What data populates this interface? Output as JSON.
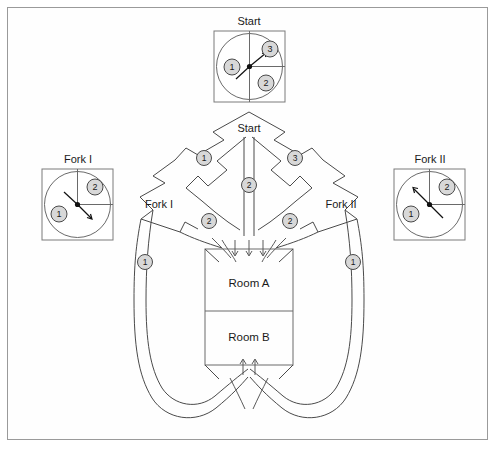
{
  "figure": {
    "title": "",
    "background_color": "#ffffff",
    "frame_color": "#9a9a9a"
  },
  "insets": [
    {
      "id": "start",
      "label": "Start",
      "segments": [
        {
          "number": "1",
          "position": "left-half"
        },
        {
          "number": "2",
          "position": "lower-right-quadrant"
        },
        {
          "number": "3",
          "position": "upper-right-quadrant"
        }
      ],
      "arrow_direction": "up-right",
      "arrow_target": "3"
    },
    {
      "id": "fork-1",
      "label": "Fork I",
      "segments": [
        {
          "number": "1",
          "position": "lower-left"
        },
        {
          "number": "2",
          "position": "upper-right-quadrant"
        }
      ],
      "arrow_direction": "down-right",
      "arrow_target": "1"
    },
    {
      "id": "fork-2",
      "label": "Fork II",
      "segments": [
        {
          "number": "1",
          "position": "lower-left"
        },
        {
          "number": "2",
          "position": "upper-right-quadrant"
        }
      ],
      "arrow_direction": "up-left",
      "arrow_target": "2"
    }
  ],
  "maze": {
    "start_label": "Start",
    "fork_1_label": "Fork I",
    "fork_2_label": "Fork II",
    "rooms": [
      {
        "id": "room-a",
        "label": "Room A"
      },
      {
        "id": "room-b",
        "label": "Room B"
      }
    ],
    "path_badges": [
      {
        "number": "1",
        "location": "start-left-arm"
      },
      {
        "number": "3",
        "location": "start-right-arm"
      },
      {
        "number": "2",
        "location": "start-center-corridor"
      },
      {
        "number": "2",
        "location": "fork-1-inner-arm"
      },
      {
        "number": "2",
        "location": "fork-2-inner-arm"
      },
      {
        "number": "1",
        "location": "fork-1-outer-loop"
      },
      {
        "number": "1",
        "location": "fork-2-outer-loop"
      }
    ],
    "flow_arrows": {
      "into_room_a": 3,
      "into_room_b": 2
    }
  },
  "colors": {
    "stroke": "#4a4a4a",
    "badge_fill": "#d8d8d8",
    "text": "#1a1a1a"
  }
}
